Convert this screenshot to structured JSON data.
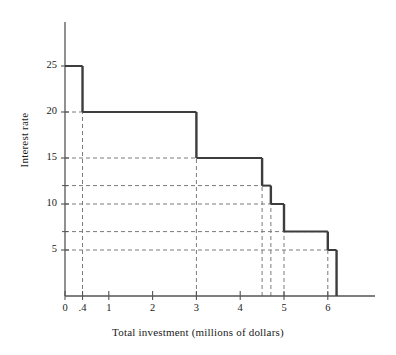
{
  "chart_data": {
    "type": "line",
    "subtype": "step-function",
    "title": "",
    "xlabel": "Total investment (millions of dollars)",
    "ylabel": "Interest rate",
    "xlim": [
      0,
      6.9
    ],
    "ylim": [
      0,
      30
    ],
    "grid": "dashed-guides",
    "legend": "none",
    "xticks": [
      {
        "value": 0,
        "label": "0"
      },
      {
        "value": 0.4,
        "label": ".4"
      },
      {
        "value": 1,
        "label": "1"
      },
      {
        "value": 2,
        "label": "2"
      },
      {
        "value": 3,
        "label": "3"
      },
      {
        "value": 4,
        "label": "4"
      },
      {
        "value": 5,
        "label": "5"
      },
      {
        "value": 6,
        "label": "6"
      }
    ],
    "yticks": [
      {
        "value": 5,
        "label": "5"
      },
      {
        "value": 10,
        "label": "10"
      },
      {
        "value": 15,
        "label": "15"
      },
      {
        "value": 20,
        "label": "20"
      },
      {
        "value": 25,
        "label": "25"
      }
    ],
    "y_minor_ticks": [
      7,
      12
    ],
    "steps": [
      {
        "x_start": 0.0,
        "x_end": 0.4,
        "rate": 25
      },
      {
        "x_start": 0.4,
        "x_end": 3.0,
        "rate": 20
      },
      {
        "x_start": 3.0,
        "x_end": 4.5,
        "rate": 15
      },
      {
        "x_start": 4.5,
        "x_end": 4.7,
        "rate": 12
      },
      {
        "x_start": 4.7,
        "x_end": 5.0,
        "rate": 10
      },
      {
        "x_start": 5.0,
        "x_end": 6.0,
        "rate": 7
      },
      {
        "x_start": 6.0,
        "x_end": 6.2,
        "rate": 5
      }
    ],
    "risers": [
      {
        "x": 0.4,
        "from": 25,
        "to": 20
      },
      {
        "x": 3.0,
        "from": 20,
        "to": 15
      },
      {
        "x": 4.5,
        "from": 15,
        "to": 12
      },
      {
        "x": 4.7,
        "from": 12,
        "to": 10
      },
      {
        "x": 5.0,
        "from": 10,
        "to": 7
      },
      {
        "x": 6.0,
        "from": 7,
        "to": 5
      },
      {
        "x": 6.2,
        "from": 5,
        "to": 0
      }
    ],
    "guide_lines_horizontal": [
      25,
      20,
      15,
      12,
      10,
      7,
      5
    ],
    "guide_lines_vertical": [
      0.4,
      3.0,
      4.5,
      4.7,
      5.0,
      6.0
    ],
    "colors": {
      "axis": "#555555",
      "step_line": "#3d3d3d",
      "guide": "#7a7a7a",
      "text": "#1a1a1a",
      "background": "#ffffff"
    }
  }
}
